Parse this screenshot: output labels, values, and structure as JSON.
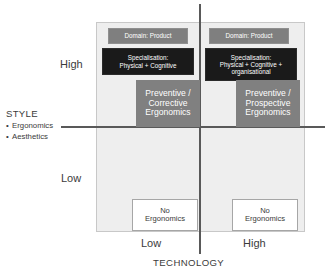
{
  "diagram": {
    "axes": {
      "x": {
        "title": "TECHNOLOGY",
        "ticks": [
          "Low",
          "High"
        ]
      },
      "y": {
        "title": "STYLE",
        "subitems": [
          "Ergonomics",
          "Aesthetics"
        ],
        "bullet_glyph": "•",
        "ticks": [
          "High",
          "Low"
        ]
      }
    },
    "quadrants": {
      "top_left": {
        "domain_label": "Domain: Product",
        "specialisation_label": "Specialisation:\nPhysical + Cognitive",
        "specialisation_lines": [
          "Specialisation:",
          "Physical + Cognitive"
        ],
        "outcome_lines": [
          "Preventive /",
          "Corrective",
          "Ergonomics"
        ]
      },
      "top_right": {
        "domain_label": "Domain: Product",
        "specialisation_lines": [
          "Specialisation:",
          "Physical + Cognitive +",
          "organisational"
        ],
        "outcome_lines": [
          "Preventive /",
          "Prospective",
          "Ergonomics"
        ]
      },
      "bottom_left": {
        "outcome_lines": [
          "No",
          "Ergonomics"
        ]
      },
      "bottom_right": {
        "outcome_lines": [
          "No",
          "Ergonomics"
        ]
      }
    },
    "colors": {
      "plot_background": "#eeeeee",
      "domain_box": "#7f7f7f",
      "specialisation_box": "#1a1a1a",
      "outcome_box": "#808080",
      "no_ergonomics_box": "#ffffff",
      "axis_line": "#595959",
      "text_dark": "#3b3b3b",
      "text_light": "#ffffff"
    }
  }
}
